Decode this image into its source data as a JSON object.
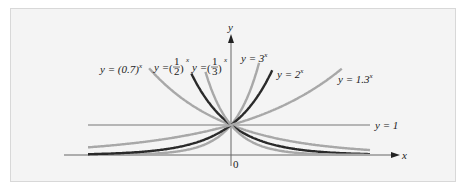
{
  "chart_data": {
    "type": "line",
    "title": "",
    "xlabel": "x",
    "ylabel": "y",
    "origin_label": "0",
    "asymptote_label": "y = 1",
    "grid": false,
    "legend_position": "inline labels at curve ends",
    "xlim": [
      -5.2,
      5.1
    ],
    "ylim": [
      0,
      4
    ],
    "series": [
      {
        "name": "y = (0.7)^x",
        "base": 0.7,
        "color": "#a8a8a8",
        "label_text": "y = (0.7)",
        "exp": "x"
      },
      {
        "name": "y = (1/2)^x",
        "base": 0.5,
        "color": "#2a2a2a",
        "label_text": "y = (1/2)",
        "exp": "x"
      },
      {
        "name": "y = (1/3)^x",
        "base": 0.3333,
        "color": "#a8a8a8",
        "label_text": "y = (1/3)",
        "exp": "x"
      },
      {
        "name": "y = 3^x",
        "base": 3,
        "color": "#a8a8a8",
        "label_text": "y = 3",
        "exp": "x"
      },
      {
        "name": "y = 2^x",
        "base": 2,
        "color": "#2a2a2a",
        "label_text": "y = 2",
        "exp": "x"
      },
      {
        "name": "y = 1.3^x",
        "base": 1.3,
        "color": "#a8a8a8",
        "label_text": "y = 1.3",
        "exp": "x"
      }
    ],
    "reference_lines": [
      {
        "type": "horizontal",
        "y": 1,
        "label": "y = 1"
      }
    ]
  },
  "labels": {
    "l07": "y = (0.7)",
    "l12_pre": "y =",
    "l13_pre": "y =",
    "l3": "y = 3",
    "l2": "y = 2",
    "l13x": "y = 1.3",
    "exp": "x",
    "one": "1",
    "two": "2",
    "three": "3",
    "yaxis": "y",
    "xaxis": "x",
    "zero": "0",
    "yeq1": "y = 1"
  }
}
